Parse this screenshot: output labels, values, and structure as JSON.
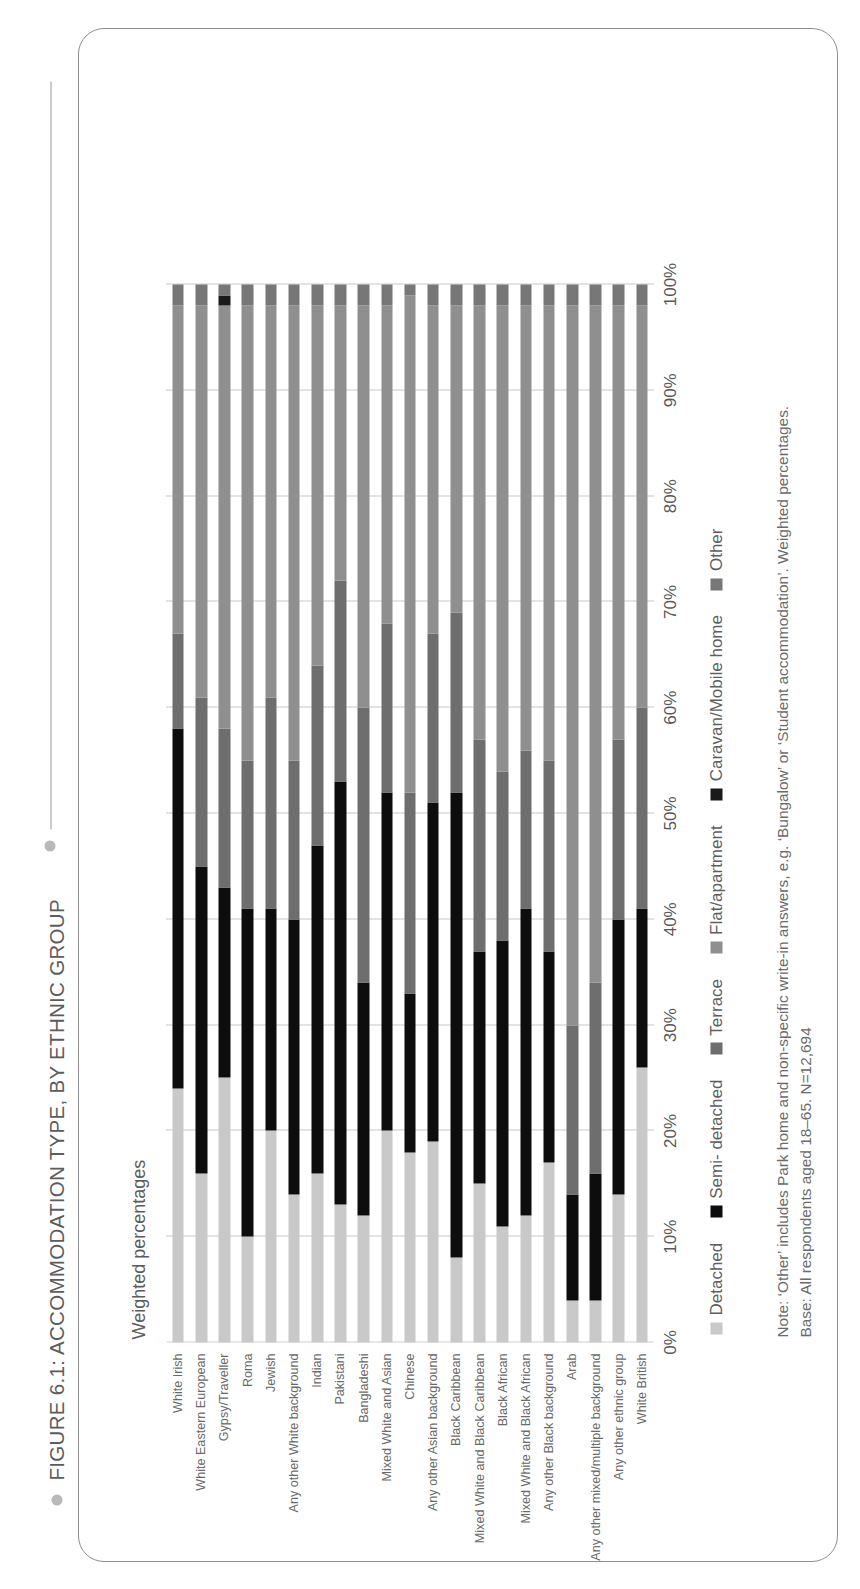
{
  "figure": {
    "title": "FIGURE 6.1: ACCOMMODATION TYPE, BY ETHNIC GROUP",
    "subtitle": "Weighted percentages"
  },
  "notes": {
    "line1": "Note: ‘Other’ includes Park home and non-specific write-in answers, e.g. ‘Bungalow’ or ‘Student accommodation’. Weighted percentages.",
    "line2": "Base: All respondents aged 18–65. N=12,694"
  },
  "colors": {
    "detached": "#c9c9c9",
    "semi_detached": "#0d0d0d",
    "terrace": "#6e6e6e",
    "flat_apartment": "#8f8f8f",
    "caravan_mobile_home": "#1a1a1a",
    "other": "#777777",
    "grid": "#8f8f8f",
    "text": "#5c5c5c",
    "border": "#8d8d8d"
  },
  "chart_data": {
    "type": "bar",
    "orientation": "horizontal",
    "stacked": "100%",
    "title": "FIGURE 6.1: ACCOMMODATION TYPE, BY ETHNIC GROUP",
    "subtitle": "Weighted percentages",
    "xlabel": "",
    "ylabel": "",
    "xlim": [
      0,
      100
    ],
    "grid": true,
    "legend_position": "bottom",
    "tick_labels": [
      "0%",
      "10%",
      "20%",
      "30%",
      "40%",
      "50%",
      "60%",
      "70%",
      "80%",
      "90%",
      "100%"
    ],
    "categories": [
      "White Irish",
      "White Eastern European",
      "Gypsy/Traveller",
      "Roma",
      "Jewish",
      "Any other White background",
      "Indian",
      "Pakistani",
      "Bangladeshi",
      "Mixed White and Asian",
      "Chinese",
      "Any other Asian background",
      "Black Caribbean",
      "Mixed White and Black Caribbean",
      "Black African",
      "Mixed White and Black African",
      "Any other Black background",
      "Arab",
      "Any other mixed/multiple background",
      "Any other ethnic group",
      "White British"
    ],
    "series": [
      {
        "name": "Detached",
        "color": "#c9c9c9",
        "values": [
          24,
          16,
          25,
          10,
          20,
          14,
          16,
          13,
          12,
          20,
          18,
          19,
          8,
          15,
          11,
          12,
          17,
          4,
          4,
          14,
          26
        ]
      },
      {
        "name": "Semi- detached",
        "color": "#0d0d0d",
        "values": [
          34,
          29,
          18,
          31,
          21,
          26,
          31,
          40,
          22,
          32,
          15,
          32,
          44,
          22,
          27,
          29,
          20,
          10,
          12,
          26,
          15
        ]
      },
      {
        "name": "Terrace",
        "color": "#6e6e6e",
        "values": [
          9,
          16,
          15,
          14,
          20,
          15,
          17,
          19,
          26,
          16,
          19,
          16,
          17,
          20,
          16,
          15,
          18,
          16,
          18,
          17,
          19
        ]
      },
      {
        "name": "Flat/apartment",
        "color": "#8f8f8f",
        "values": [
          31,
          37,
          40,
          43,
          37,
          43,
          34,
          26,
          38,
          30,
          47,
          31,
          29,
          41,
          44,
          42,
          43,
          68,
          64,
          41,
          38
        ]
      },
      {
        "name": "Caravan/Mobile home",
        "color": "#1a1a1a",
        "values": [
          0,
          0,
          1,
          0,
          0,
          0,
          0,
          0,
          0,
          0,
          0,
          0,
          0,
          0,
          0,
          0,
          0,
          0,
          0,
          0,
          0
        ]
      },
      {
        "name": "Other",
        "color": "#777777",
        "values": [
          2,
          2,
          1,
          2,
          2,
          2,
          2,
          2,
          2,
          2,
          1,
          2,
          2,
          2,
          2,
          2,
          2,
          2,
          2,
          2,
          2
        ]
      }
    ]
  }
}
